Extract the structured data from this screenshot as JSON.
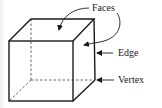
{
  "figure": {
    "labels": {
      "faces": "Faces",
      "edge": "Edge",
      "vertex": "Vertex"
    },
    "colors": {
      "line": "#1a1a1a",
      "dashed": "#555555",
      "text": "#222222",
      "background": "#ffffff"
    }
  }
}
